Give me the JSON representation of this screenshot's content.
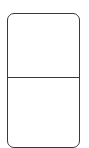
{
  "domino": {
    "top_value": 6,
    "bottom_value": 0,
    "pip_color": "#1e1e1e",
    "border_color": "#3a3a3a",
    "face_color": "#ffffff",
    "top_pips": [
      {
        "x": 15.5,
        "y": 17.5
      },
      {
        "x": 32.5,
        "y": 17.5
      },
      {
        "x": 49.5,
        "y": 17.5
      },
      {
        "x": 15.5,
        "y": 36.5
      },
      {
        "x": 32.5,
        "y": 36.5
      },
      {
        "x": 49.5,
        "y": 36.5
      }
    ]
  }
}
